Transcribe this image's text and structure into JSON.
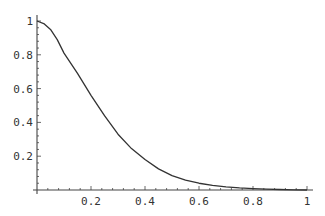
{
  "chart_data": {
    "type": "line",
    "title": "",
    "xlabel": "",
    "ylabel": "",
    "xlim": [
      0,
      1
    ],
    "ylim": [
      0,
      1
    ],
    "grid": false,
    "legend": null,
    "x_ticks": [
      "0.2",
      "0.4",
      "0.6",
      "0.8",
      "1"
    ],
    "y_ticks": [
      "0.2",
      "0.4",
      "0.6",
      "0.8",
      "1"
    ],
    "series": [
      {
        "name": "curve",
        "color": "#333333",
        "x": [
          0,
          0.025,
          0.05,
          0.075,
          0.1,
          0.15,
          0.2,
          0.25,
          0.3,
          0.35,
          0.4,
          0.45,
          0.5,
          0.55,
          0.6,
          0.65,
          0.7,
          0.75,
          0.8,
          0.85,
          0.9,
          0.95,
          1.0
        ],
        "y": [
          1.0,
          0.985,
          0.95,
          0.89,
          0.81,
          0.69,
          0.56,
          0.44,
          0.33,
          0.245,
          0.18,
          0.125,
          0.085,
          0.058,
          0.04,
          0.027,
          0.018,
          0.012,
          0.008,
          0.005,
          0.003,
          0.001,
          0.0
        ]
      }
    ]
  },
  "axes": {
    "x_tick_labels": [
      "0.2",
      "0.4",
      "0.6",
      "0.8",
      "1"
    ],
    "y_tick_labels": [
      "0.2",
      "0.4",
      "0.6",
      "0.8",
      "1"
    ]
  }
}
